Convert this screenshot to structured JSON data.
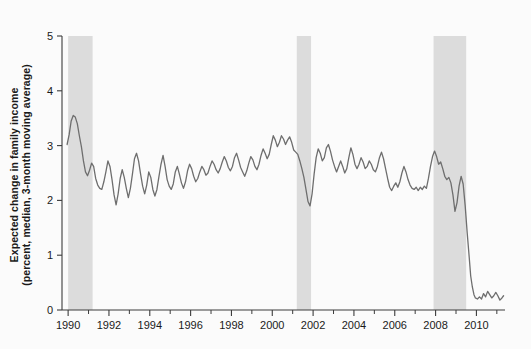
{
  "chart_data": {
    "type": "line",
    "title": "",
    "subtitle": "",
    "xlabel": "",
    "ylabel": "Expected change in family income (percent, median, 3-month moving average)",
    "ylabel_line1": "Expected change in family income",
    "ylabel_line2": "(percent, median, 3-month moving average)",
    "xlim": [
      1989.7,
      2011.4
    ],
    "ylim": [
      0,
      5
    ],
    "yticks": [
      0,
      1,
      2,
      3,
      4,
      5
    ],
    "ytick_labels": [
      "0",
      "1",
      "2",
      "3",
      "4",
      "5"
    ],
    "xticks_major": [
      1990,
      1992,
      1994,
      1996,
      1998,
      2000,
      2002,
      2004,
      2006,
      2008,
      2010
    ],
    "xtick_labels": [
      "1990",
      "1992",
      "1994",
      "1996",
      "1998",
      "2000",
      "2002",
      "2004",
      "2006",
      "2008",
      "2010"
    ],
    "xticks_minor": [
      1991,
      1993,
      1995,
      1997,
      1999,
      2001,
      2003,
      2005,
      2007,
      2009,
      2011
    ],
    "grid": false,
    "legend": null,
    "line_color": "#6e6e6e",
    "line_width": 1.3,
    "band_color": "#dcdcdc",
    "background_color": "#fbfbfb",
    "axis_color": "#3c3c3c",
    "recession_bands": [
      {
        "label": "1990-91 recession",
        "start": 1990.0,
        "end": 1991.2
      },
      {
        "label": "2001 recession",
        "start": 2001.2,
        "end": 2001.9
      },
      {
        "label": "2007-09 recession",
        "start": 2007.9,
        "end": 2009.5
      }
    ],
    "series": [
      {
        "name": "Expected change in family income",
        "points": [
          [
            1989.95,
            3.02
          ],
          [
            1990.05,
            3.2
          ],
          [
            1990.15,
            3.45
          ],
          [
            1990.25,
            3.55
          ],
          [
            1990.35,
            3.52
          ],
          [
            1990.45,
            3.4
          ],
          [
            1990.55,
            3.18
          ],
          [
            1990.65,
            2.98
          ],
          [
            1990.75,
            2.72
          ],
          [
            1990.85,
            2.52
          ],
          [
            1990.95,
            2.45
          ],
          [
            1991.05,
            2.55
          ],
          [
            1991.15,
            2.68
          ],
          [
            1991.25,
            2.62
          ],
          [
            1991.35,
            2.4
          ],
          [
            1991.45,
            2.28
          ],
          [
            1991.55,
            2.22
          ],
          [
            1991.65,
            2.2
          ],
          [
            1991.75,
            2.34
          ],
          [
            1991.85,
            2.52
          ],
          [
            1991.95,
            2.72
          ],
          [
            1992.05,
            2.62
          ],
          [
            1992.15,
            2.38
          ],
          [
            1992.25,
            2.1
          ],
          [
            1992.35,
            1.92
          ],
          [
            1992.45,
            2.12
          ],
          [
            1992.55,
            2.4
          ],
          [
            1992.65,
            2.56
          ],
          [
            1992.75,
            2.42
          ],
          [
            1992.85,
            2.22
          ],
          [
            1992.95,
            2.05
          ],
          [
            1993.05,
            2.22
          ],
          [
            1993.15,
            2.48
          ],
          [
            1993.25,
            2.76
          ],
          [
            1993.35,
            2.86
          ],
          [
            1993.45,
            2.72
          ],
          [
            1993.55,
            2.48
          ],
          [
            1993.65,
            2.26
          ],
          [
            1993.75,
            2.12
          ],
          [
            1993.85,
            2.28
          ],
          [
            1993.95,
            2.52
          ],
          [
            1994.05,
            2.42
          ],
          [
            1994.15,
            2.2
          ],
          [
            1994.25,
            2.08
          ],
          [
            1994.35,
            2.2
          ],
          [
            1994.45,
            2.44
          ],
          [
            1994.55,
            2.66
          ],
          [
            1994.65,
            2.82
          ],
          [
            1994.75,
            2.62
          ],
          [
            1994.85,
            2.38
          ],
          [
            1994.95,
            2.26
          ],
          [
            1995.05,
            2.2
          ],
          [
            1995.15,
            2.3
          ],
          [
            1995.25,
            2.52
          ],
          [
            1995.35,
            2.62
          ],
          [
            1995.45,
            2.48
          ],
          [
            1995.55,
            2.32
          ],
          [
            1995.65,
            2.22
          ],
          [
            1995.75,
            2.34
          ],
          [
            1995.85,
            2.54
          ],
          [
            1995.95,
            2.66
          ],
          [
            1996.05,
            2.58
          ],
          [
            1996.15,
            2.44
          ],
          [
            1996.25,
            2.34
          ],
          [
            1996.35,
            2.4
          ],
          [
            1996.45,
            2.52
          ],
          [
            1996.55,
            2.62
          ],
          [
            1996.65,
            2.56
          ],
          [
            1996.75,
            2.46
          ],
          [
            1996.85,
            2.5
          ],
          [
            1996.95,
            2.62
          ],
          [
            1997.05,
            2.72
          ],
          [
            1997.15,
            2.66
          ],
          [
            1997.25,
            2.56
          ],
          [
            1997.35,
            2.5
          ],
          [
            1997.45,
            2.58
          ],
          [
            1997.55,
            2.7
          ],
          [
            1997.65,
            2.8
          ],
          [
            1997.75,
            2.72
          ],
          [
            1997.85,
            2.6
          ],
          [
            1997.95,
            2.54
          ],
          [
            1998.05,
            2.62
          ],
          [
            1998.15,
            2.78
          ],
          [
            1998.25,
            2.86
          ],
          [
            1998.35,
            2.74
          ],
          [
            1998.45,
            2.6
          ],
          [
            1998.55,
            2.52
          ],
          [
            1998.65,
            2.44
          ],
          [
            1998.75,
            2.54
          ],
          [
            1998.85,
            2.68
          ],
          [
            1998.95,
            2.8
          ],
          [
            1999.05,
            2.74
          ],
          [
            1999.15,
            2.62
          ],
          [
            1999.25,
            2.56
          ],
          [
            1999.35,
            2.66
          ],
          [
            1999.45,
            2.82
          ],
          [
            1999.55,
            2.94
          ],
          [
            1999.65,
            2.86
          ],
          [
            1999.75,
            2.76
          ],
          [
            1999.85,
            2.84
          ],
          [
            1999.95,
            3.02
          ],
          [
            2000.05,
            3.18
          ],
          [
            2000.15,
            3.1
          ],
          [
            2000.25,
            2.98
          ],
          [
            2000.35,
            3.06
          ],
          [
            2000.45,
            3.18
          ],
          [
            2000.55,
            3.12
          ],
          [
            2000.65,
            3.02
          ],
          [
            2000.75,
            3.1
          ],
          [
            2000.85,
            3.16
          ],
          [
            2000.95,
            3.06
          ],
          [
            2001.05,
            2.92
          ],
          [
            2001.15,
            2.88
          ],
          [
            2001.25,
            2.84
          ],
          [
            2001.35,
            2.72
          ],
          [
            2001.45,
            2.58
          ],
          [
            2001.55,
            2.42
          ],
          [
            2001.65,
            2.2
          ],
          [
            2001.75,
            1.98
          ],
          [
            2001.85,
            1.9
          ],
          [
            2001.95,
            2.12
          ],
          [
            2002.05,
            2.48
          ],
          [
            2002.15,
            2.78
          ],
          [
            2002.25,
            2.94
          ],
          [
            2002.35,
            2.86
          ],
          [
            2002.45,
            2.72
          ],
          [
            2002.55,
            2.78
          ],
          [
            2002.65,
            2.96
          ],
          [
            2002.75,
            3.02
          ],
          [
            2002.85,
            2.9
          ],
          [
            2002.95,
            2.74
          ],
          [
            2003.05,
            2.62
          ],
          [
            2003.15,
            2.52
          ],
          [
            2003.25,
            2.62
          ],
          [
            2003.35,
            2.72
          ],
          [
            2003.45,
            2.62
          ],
          [
            2003.55,
            2.5
          ],
          [
            2003.65,
            2.58
          ],
          [
            2003.75,
            2.78
          ],
          [
            2003.85,
            2.96
          ],
          [
            2003.95,
            2.84
          ],
          [
            2004.05,
            2.66
          ],
          [
            2004.15,
            2.58
          ],
          [
            2004.25,
            2.66
          ],
          [
            2004.35,
            2.78
          ],
          [
            2004.45,
            2.7
          ],
          [
            2004.55,
            2.58
          ],
          [
            2004.65,
            2.62
          ],
          [
            2004.75,
            2.72
          ],
          [
            2004.85,
            2.66
          ],
          [
            2004.95,
            2.56
          ],
          [
            2005.05,
            2.52
          ],
          [
            2005.15,
            2.62
          ],
          [
            2005.25,
            2.78
          ],
          [
            2005.35,
            2.88
          ],
          [
            2005.45,
            2.76
          ],
          [
            2005.55,
            2.58
          ],
          [
            2005.65,
            2.4
          ],
          [
            2005.75,
            2.24
          ],
          [
            2005.85,
            2.18
          ],
          [
            2005.95,
            2.26
          ],
          [
            2006.05,
            2.32
          ],
          [
            2006.15,
            2.24
          ],
          [
            2006.25,
            2.34
          ],
          [
            2006.35,
            2.5
          ],
          [
            2006.45,
            2.62
          ],
          [
            2006.55,
            2.52
          ],
          [
            2006.65,
            2.38
          ],
          [
            2006.75,
            2.28
          ],
          [
            2006.85,
            2.22
          ],
          [
            2006.95,
            2.2
          ],
          [
            2007.05,
            2.24
          ],
          [
            2007.15,
            2.18
          ],
          [
            2007.25,
            2.24
          ],
          [
            2007.35,
            2.2
          ],
          [
            2007.45,
            2.26
          ],
          [
            2007.55,
            2.22
          ],
          [
            2007.65,
            2.4
          ],
          [
            2007.75,
            2.62
          ],
          [
            2007.85,
            2.8
          ],
          [
            2007.95,
            2.9
          ],
          [
            2008.05,
            2.8
          ],
          [
            2008.15,
            2.66
          ],
          [
            2008.25,
            2.7
          ],
          [
            2008.35,
            2.58
          ],
          [
            2008.45,
            2.44
          ],
          [
            2008.55,
            2.38
          ],
          [
            2008.65,
            2.42
          ],
          [
            2008.75,
            2.32
          ],
          [
            2008.85,
            2.1
          ],
          [
            2008.95,
            1.8
          ],
          [
            2009.05,
            1.96
          ],
          [
            2009.15,
            2.26
          ],
          [
            2009.25,
            2.44
          ],
          [
            2009.35,
            2.3
          ],
          [
            2009.45,
            1.9
          ],
          [
            2009.55,
            1.4
          ],
          [
            2009.65,
            0.95
          ],
          [
            2009.72,
            0.62
          ],
          [
            2009.8,
            0.42
          ],
          [
            2009.88,
            0.28
          ],
          [
            2009.95,
            0.22
          ],
          [
            2010.05,
            0.2
          ],
          [
            2010.15,
            0.24
          ],
          [
            2010.25,
            0.2
          ],
          [
            2010.35,
            0.3
          ],
          [
            2010.45,
            0.24
          ],
          [
            2010.55,
            0.34
          ],
          [
            2010.65,
            0.28
          ],
          [
            2010.75,
            0.22
          ],
          [
            2010.85,
            0.26
          ],
          [
            2010.95,
            0.32
          ],
          [
            2011.05,
            0.26
          ],
          [
            2011.15,
            0.18
          ],
          [
            2011.25,
            0.22
          ],
          [
            2011.33,
            0.26
          ]
        ]
      }
    ]
  }
}
